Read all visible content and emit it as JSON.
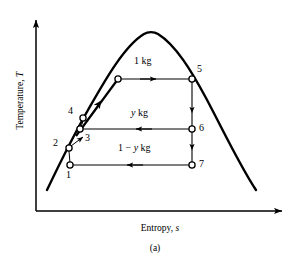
{
  "figure": {
    "caption": "(a)",
    "type": "T-s diagram (temperature-entropy) of a regenerative Rankine cycle with open feedwater heater"
  },
  "axes": {
    "y_label_text": "Temperature,",
    "y_label_symbol": "T",
    "x_label_text": "Entropy,",
    "x_label_symbol": "s",
    "origin_x": 36,
    "origin_y": 211,
    "x_axis_end": 290,
    "y_axis_top": 13,
    "color": "#000000"
  },
  "dome": {
    "name": "saturation-dome",
    "peak_x": 151,
    "peak_y": 32,
    "left_end_x": 47,
    "left_end_y": 190,
    "right_end_x": 256,
    "right_end_y": 190,
    "color": "#000000",
    "stroke_width": 2.4
  },
  "states": [
    {
      "id": "1",
      "label": "1",
      "x": 70,
      "y": 165,
      "label_dx": -2,
      "label_dy": 10
    },
    {
      "id": "2",
      "label": "2",
      "x": 69,
      "y": 148,
      "label_dx": -14,
      "label_dy": -5
    },
    {
      "id": "3",
      "label": "3",
      "x": 80,
      "y": 129,
      "label_dx": 4,
      "label_dy": 9
    },
    {
      "id": "4",
      "label": "4",
      "x": 83,
      "y": 118,
      "label_dx": -14,
      "label_dy": -7
    },
    {
      "id": "5",
      "label": "5",
      "x": 192,
      "y": 79,
      "label_dx": 4,
      "label_dy": -8
    },
    {
      "id": "6",
      "label": "6",
      "x": 192,
      "y": 129,
      "label_dx": 7,
      "label_dy": 1
    },
    {
      "id": "7",
      "label": "7",
      "x": 192,
      "y": 165,
      "label_dx": 7,
      "label_dy": 1
    },
    {
      "id": "turbine-inlet",
      "label": "",
      "x": 118,
      "y": 79,
      "label_dx": 0,
      "label_dy": 0
    }
  ],
  "flows": [
    {
      "name": "mass-flow-1kg",
      "text_plain": "1 kg",
      "text_italic": "",
      "text_suffix": "",
      "label_x": 136,
      "label_y": 62,
      "from_x": 118,
      "from_y": 79,
      "to_x": 192,
      "to_y": 79,
      "direction": "right"
    },
    {
      "name": "mass-flow-y-kg",
      "text_plain": "",
      "text_italic": "y",
      "text_suffix": " kg",
      "label_x": 133,
      "label_y": 114,
      "from_x": 192,
      "from_y": 129,
      "to_x": 80,
      "to_y": 129,
      "direction": "left"
    },
    {
      "name": "mass-flow-1-minus-y-kg",
      "text_plain": "1 − ",
      "text_italic": "y",
      "text_suffix": " kg",
      "label_x": 124,
      "label_y": 148,
      "from_x": 192,
      "from_y": 165,
      "to_x": 70,
      "to_y": 165,
      "direction": "left"
    }
  ],
  "vertical_segments": [
    {
      "name": "expansion-5-to-6",
      "x": 192,
      "from_y": 79,
      "to_y": 129
    },
    {
      "name": "expansion-6-to-7",
      "x": 192,
      "from_y": 129,
      "to_y": 165
    }
  ],
  "pump_segments": [
    {
      "name": "pump-1-to-2",
      "from_x": 70,
      "from_y": 165,
      "to_x": 69,
      "to_y": 148
    },
    {
      "name": "pump-3-to-4",
      "from_x": 80,
      "from_y": 129,
      "to_x": 83,
      "to_y": 118
    }
  ],
  "heating_path": {
    "name": "heat-addition-3-to-5",
    "from_x": 76,
    "from_y": 134,
    "to_x": 118,
    "to_y": 79,
    "arrow_at_x": 99,
    "arrow_at_y": 104
  },
  "colors": {
    "line": "#000000",
    "background": "#ffffff"
  }
}
